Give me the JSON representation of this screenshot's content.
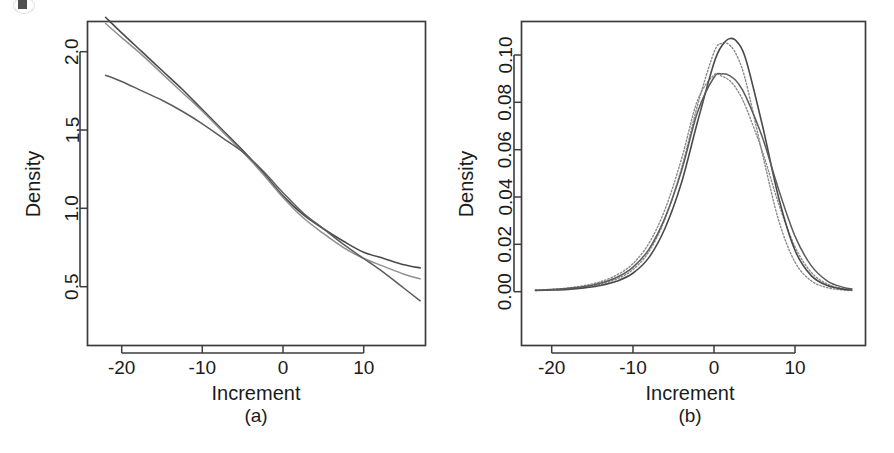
{
  "figure": {
    "background_color": "#ffffff",
    "ink_color": "#3c3c3c",
    "panels": [
      {
        "id": "a",
        "caption": "(a)",
        "xlabel": "Increment",
        "ylabel": "Density"
      },
      {
        "id": "b",
        "caption": "(b)",
        "xlabel": "Increment",
        "ylabel": "Density"
      }
    ]
  },
  "chart_data": [
    {
      "type": "line",
      "panel": "a",
      "title": "",
      "caption": "(a)",
      "xlabel": "Increment",
      "ylabel": "Density",
      "xlim": [
        -22.5,
        17.5
      ],
      "ylim": [
        0.33,
        2.27
      ],
      "xticks": [
        -20,
        -10,
        0,
        10
      ],
      "xticklabels": [
        "-20",
        "-10",
        "0",
        "10"
      ],
      "yticks": [
        0.5,
        1.0,
        1.5,
        2.0
      ],
      "yticklabels": [
        "0.5",
        "1.0",
        "1.5",
        "2.0"
      ],
      "grid": false,
      "legend": "none",
      "x": [
        -22,
        -20,
        -17.5,
        -15,
        -12.5,
        -10,
        -7.5,
        -5,
        -2.5,
        0,
        2.5,
        5,
        7.5,
        10,
        12.5,
        15,
        17
      ],
      "series": [
        {
          "name": "curve-1-dark",
          "style": "solid",
          "color": "#4a4a4a",
          "values": [
            2.22,
            2.12,
            2.0,
            1.88,
            1.76,
            1.63,
            1.5,
            1.37,
            1.23,
            1.08,
            0.96,
            0.87,
            0.79,
            0.72,
            0.68,
            0.64,
            0.62
          ]
        },
        {
          "name": "curve-2-light",
          "style": "solid",
          "color": "#8f8f8f",
          "values": [
            2.18,
            2.09,
            1.98,
            1.86,
            1.74,
            1.62,
            1.49,
            1.36,
            1.22,
            1.07,
            0.94,
            0.84,
            0.75,
            0.68,
            0.63,
            0.58,
            0.55
          ]
        },
        {
          "name": "curve-3-straight",
          "style": "solid",
          "color": "#5c5c5c",
          "values": [
            1.85,
            1.81,
            1.75,
            1.69,
            1.62,
            1.54,
            1.45,
            1.36,
            1.24,
            1.1,
            0.97,
            0.87,
            0.77,
            0.68,
            0.59,
            0.49,
            0.41
          ]
        }
      ]
    },
    {
      "type": "line",
      "panel": "b",
      "title": "",
      "caption": "(b)",
      "xlabel": "Increment",
      "ylabel": "Density",
      "xlim": [
        -22.5,
        17.5
      ],
      "ylim": [
        -0.002,
        0.112
      ],
      "xticks": [
        -20,
        -10,
        0,
        10
      ],
      "xticklabels": [
        "-20",
        "-10",
        "0",
        "10"
      ],
      "yticks": [
        0.0,
        0.02,
        0.04,
        0.06,
        0.08,
        0.1
      ],
      "yticklabels": [
        "0.00",
        "0.02",
        "0.04",
        "0.06",
        "0.08",
        "0.10"
      ],
      "grid": false,
      "legend": "none",
      "x": [
        -22,
        -20,
        -18,
        -16,
        -14,
        -12,
        -10,
        -8,
        -6,
        -4,
        -2,
        0,
        1,
        2,
        3,
        4,
        6,
        8,
        10,
        12,
        14,
        16,
        17
      ],
      "series": [
        {
          "name": "peaked-solid",
          "style": "solid",
          "color": "#4a4a4a",
          "values": [
            0.0005,
            0.0007,
            0.001,
            0.0016,
            0.0026,
            0.0044,
            0.0078,
            0.0145,
            0.027,
            0.046,
            0.072,
            0.0965,
            0.104,
            0.107,
            0.105,
            0.0975,
            0.07,
            0.0395,
            0.0175,
            0.0068,
            0.0026,
            0.001,
            0.0007
          ]
        },
        {
          "name": "peaked-dotted",
          "style": "dotted",
          "color": "#8a8a8a",
          "values": [
            0.0005,
            0.0008,
            0.0012,
            0.0019,
            0.0031,
            0.0053,
            0.0093,
            0.017,
            0.031,
            0.052,
            0.079,
            0.101,
            0.105,
            0.104,
            0.0985,
            0.088,
            0.058,
            0.03,
            0.0125,
            0.0046,
            0.0017,
            0.0007,
            0.0005
          ]
        },
        {
          "name": "flat-solid",
          "style": "solid",
          "color": "#5c5c5c",
          "values": [
            0.0006,
            0.0009,
            0.0014,
            0.0022,
            0.0036,
            0.006,
            0.0103,
            0.018,
            0.0315,
            0.051,
            0.076,
            0.0905,
            0.092,
            0.0912,
            0.088,
            0.082,
            0.065,
            0.043,
            0.0235,
            0.011,
            0.0045,
            0.0018,
            0.0012
          ]
        },
        {
          "name": "flat-dotted",
          "style": "dotted",
          "color": "#8a8a8a",
          "values": [
            0.0007,
            0.001,
            0.0016,
            0.0026,
            0.0042,
            0.007,
            0.0118,
            0.0205,
            0.035,
            0.056,
            0.081,
            0.0915,
            0.091,
            0.089,
            0.0845,
            0.0775,
            0.059,
            0.037,
            0.019,
            0.0082,
            0.0032,
            0.0013,
            0.0009
          ]
        }
      ]
    }
  ]
}
